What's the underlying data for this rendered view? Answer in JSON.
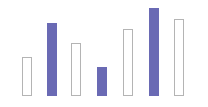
{
  "chart": {
    "background_color": "#ffffff",
    "filled_color": "#6a6ab4",
    "outline_color": "#b4b4b4",
    "outline_fill_color": "#ffffff"
  },
  "chart_data": {
    "type": "bar",
    "title": "",
    "subtitle": "",
    "xlabel": "",
    "ylabel": "",
    "grid": false,
    "legend": false,
    "legend_position": "none",
    "axis_visible": false,
    "tick_labels_visible": false,
    "categories": [
      "1",
      "2",
      "3",
      "4",
      "5",
      "6",
      "7"
    ],
    "values": [
      39,
      73,
      53,
      29,
      67,
      88,
      77
    ],
    "ylim": [
      0,
      96
    ],
    "xlim": [
      0,
      208
    ],
    "baseline_y_px": 96,
    "bar_width_px": 10,
    "series": [
      {
        "name": "values",
        "values": [
          39,
          73,
          53,
          29,
          67,
          88,
          77
        ]
      }
    ],
    "bars": [
      {
        "index": 1,
        "value": 39,
        "style": "outlined",
        "color": "#b4b4b4",
        "x_px": 22,
        "width_px": 10,
        "top_px": 57,
        "height_px": 39
      },
      {
        "index": 2,
        "value": 73,
        "style": "filled",
        "color": "#6a6ab4",
        "x_px": 47,
        "width_px": 10,
        "top_px": 23,
        "height_px": 73
      },
      {
        "index": 3,
        "value": 53,
        "style": "outlined",
        "color": "#b4b4b4",
        "x_px": 71,
        "width_px": 10,
        "top_px": 43,
        "height_px": 53
      },
      {
        "index": 4,
        "value": 29,
        "style": "filled",
        "color": "#6a6ab4",
        "x_px": 97,
        "width_px": 10,
        "top_px": 67,
        "height_px": 29
      },
      {
        "index": 5,
        "value": 67,
        "style": "outlined",
        "color": "#b4b4b4",
        "x_px": 123,
        "width_px": 10,
        "top_px": 29,
        "height_px": 67
      },
      {
        "index": 6,
        "value": 88,
        "style": "filled",
        "color": "#6a6ab4",
        "x_px": 149,
        "width_px": 10,
        "top_px": 8,
        "height_px": 88
      },
      {
        "index": 7,
        "value": 77,
        "style": "outlined",
        "color": "#b4b4b4",
        "x_px": 174,
        "width_px": 10,
        "top_px": 19,
        "height_px": 77
      }
    ]
  }
}
